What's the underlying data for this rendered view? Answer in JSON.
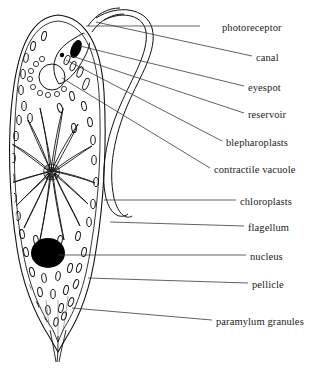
{
  "figure": {
    "organism": "Euglena",
    "style": "black and white line drawing with leader lines to right-side labels",
    "colors": {
      "outline": "#111111",
      "background": "#ffffff",
      "nucleus_fill": "#000000",
      "eyespot_fill": "#000000",
      "leader_line": "#333333",
      "label_text": "#1c1c1c"
    }
  },
  "labels": [
    {
      "id": "photoreceptor",
      "text": "photoreceptor",
      "x": 222,
      "y": 22,
      "leader_from_x": 200,
      "leader_from_y": 26,
      "leader_to_x": 86,
      "leader_to_y": 26
    },
    {
      "id": "canal",
      "text": "canal",
      "x": 256,
      "y": 52,
      "leader_from_x": 252,
      "leader_from_y": 56,
      "leader_to_x": 96,
      "leader_to_y": 22
    },
    {
      "id": "eyespot",
      "text": "eyespot",
      "x": 248,
      "y": 82,
      "leader_from_x": 244,
      "leader_from_y": 86,
      "leader_to_x": 80,
      "leader_to_y": 46
    },
    {
      "id": "reservoir",
      "text": "reservoir",
      "x": 248,
      "y": 109,
      "leader_from_x": 244,
      "leader_from_y": 113,
      "leader_to_x": 72,
      "leader_to_y": 56
    },
    {
      "id": "blepharoplasts",
      "text": "blepharoplasts",
      "x": 226,
      "y": 137,
      "leader_from_x": 222,
      "leader_from_y": 141,
      "leader_to_x": 66,
      "leader_to_y": 60
    },
    {
      "id": "contractile-vacuole",
      "text": "contractile vacuole",
      "x": 214,
      "y": 164,
      "leader_from_x": 210,
      "leader_from_y": 168,
      "leader_to_x": 62,
      "leader_to_y": 78
    },
    {
      "id": "chloroplasts",
      "text": "chloroplasts",
      "x": 240,
      "y": 196,
      "leader_from_x": 236,
      "leader_from_y": 200,
      "leader_to_x": 104,
      "leader_to_y": 200
    },
    {
      "id": "flagellum",
      "text": "flagellum",
      "x": 248,
      "y": 222,
      "leader_from_x": 244,
      "leader_from_y": 226,
      "leader_to_x": 110,
      "leader_to_y": 222
    },
    {
      "id": "nucleus",
      "text": "nucleus",
      "x": 250,
      "y": 251,
      "leader_from_x": 246,
      "leader_from_y": 255,
      "leader_to_x": 58,
      "leader_to_y": 255
    },
    {
      "id": "pellicle",
      "text": "pellicle",
      "x": 252,
      "y": 279,
      "leader_from_x": 248,
      "leader_from_y": 283,
      "leader_to_x": 88,
      "leader_to_y": 278
    },
    {
      "id": "paramylum-granules",
      "text": "paramylum granules",
      "x": 216,
      "y": 316,
      "leader_from_x": 212,
      "leader_from_y": 320,
      "leader_to_x": 72,
      "leader_to_y": 308
    }
  ],
  "structures": {
    "cell_body": {
      "name": "cell body outline",
      "description": "elongated spindle-shaped Euglena body with rounded anterior and tapered posterior tail"
    },
    "pellicle": {
      "name": "pellicle",
      "description": "double outline forming the cell surface layer"
    },
    "nucleus": {
      "name": "nucleus",
      "cx": 48,
      "cy": 253,
      "rx": 17,
      "ry": 15,
      "fill": "#000000"
    },
    "eyespot": {
      "name": "eyespot",
      "cx": 76,
      "cy": 49,
      "rx": 5,
      "ry": 9,
      "fill": "#000000"
    },
    "contractile_vacuole": {
      "name": "contractile vacuole",
      "cx": 52,
      "cy": 77,
      "r": 13
    },
    "reservoir": {
      "name": "reservoir",
      "description": "flask-shaped chamber at anterior end"
    },
    "canal": {
      "name": "canal",
      "description": "narrow tube leading from reservoir to anterior opening"
    },
    "flagellum": {
      "name": "flagellum",
      "description": "long whip-like double-stranded loop emerging from the anterior canal and trailing along the right side"
    },
    "chloroplasts": {
      "name": "chloroplasts",
      "count": 14,
      "description": "elongated blade-shaped bodies radiating from a central pyrenoid-like hub at (50,172)"
    },
    "paramylum_granules": {
      "name": "paramylum granules",
      "count": 48,
      "description": "small dark oval storage granules scattered through the cytoplasm"
    },
    "blepharoplasts": {
      "name": "blepharoplasts",
      "description": "small basal bodies at the base of the flagellum"
    },
    "photoreceptor": {
      "name": "photoreceptor",
      "description": "small swelling on the flagellum near the eyespot"
    }
  }
}
